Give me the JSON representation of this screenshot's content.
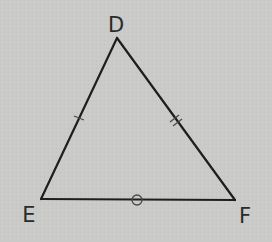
{
  "diagram": {
    "type": "triangle",
    "background_color": "#cacac8",
    "stroke_color": "#1e1e1e",
    "mark_color": "#4a4a4a",
    "vertices": [
      {
        "name": "D",
        "x": 117,
        "y": 38,
        "label_x": 116,
        "label_y": 25
      },
      {
        "name": "E",
        "x": 41,
        "y": 199,
        "label_x": 29,
        "label_y": 215
      },
      {
        "name": "F",
        "x": 235,
        "y": 200,
        "label_x": 245,
        "label_y": 216
      }
    ],
    "sides": [
      {
        "name": "DE",
        "mark": "single-tick"
      },
      {
        "name": "DF",
        "mark": "double-tick"
      },
      {
        "name": "EF",
        "mark": "circle"
      }
    ],
    "labels": {
      "D": "D",
      "E": "E",
      "F": "F"
    }
  }
}
